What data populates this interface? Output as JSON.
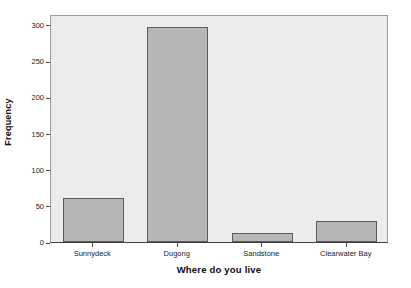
{
  "chart_data": {
    "type": "bar",
    "title": "",
    "xlabel": "Where do you live",
    "ylabel": "Frequency",
    "categories": [
      "Sunnydeck",
      "Dugong",
      "Sandstone",
      "Clearwater Bay"
    ],
    "values": [
      61,
      297,
      13,
      29
    ],
    "ylim": [
      0,
      315
    ],
    "yticks": [
      0,
      50,
      100,
      150,
      200,
      250,
      300
    ],
    "ytick_labels": [
      "0",
      "50",
      "100",
      "150",
      "200",
      "250",
      "300"
    ],
    "grid": false,
    "legend": "none",
    "colors": {
      "bar_fill": "#b6b6b6",
      "bar_border": "#5c5c5c",
      "plot_background": "#ececec",
      "plot_border": "#9a9a9a",
      "axis": "#3c3c3c",
      "text": "#1a1a1a",
      "page_background": "#ffffff"
    }
  }
}
